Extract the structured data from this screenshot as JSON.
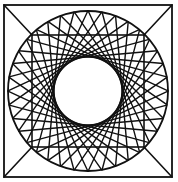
{
  "figure": {
    "stroke_color": "#111111",
    "background": "#ffffff",
    "outer_square": {
      "x": 4,
      "y": 5,
      "width": 168,
      "height": 172
    },
    "center": {
      "cx": 88,
      "cy": 91
    },
    "outer_circle_radius": 80,
    "inner_hole_radius": 34,
    "inner_square_half_side": 56,
    "chord_count": 36,
    "stroke_width": 1.4
  }
}
